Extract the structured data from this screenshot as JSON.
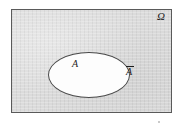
{
  "figure": {
    "kind": "venn-diagram",
    "caption": "",
    "universe": {
      "symbol": "Ω",
      "name": "omega-universal-set",
      "fill_color": "#d9d9d9",
      "border_color": "#5a5a5a"
    },
    "subset": {
      "symbol": "A",
      "name": "set-a",
      "fill_color": "#fdfdfd",
      "border_color": "#4a4a4a"
    },
    "complement": {
      "symbol": "A",
      "name": "set-a-complement",
      "notation": "overbar"
    }
  },
  "chart_data": {
    "type": "diagram",
    "title": "",
    "regions": [
      {
        "id": "omega",
        "label": "Ω",
        "description": "universal set (sample space) rectangle",
        "shape": "rectangle",
        "shaded": true,
        "x": 11,
        "y": 9,
        "width": 161,
        "height": 104
      },
      {
        "id": "A",
        "label": "A",
        "description": "event A, white ellipse inside the sample space",
        "shape": "ellipse",
        "shaded": false,
        "cx": 77,
        "cy": 65,
        "rx": 41,
        "ry": 23
      },
      {
        "id": "A-complement",
        "label": "Ā",
        "description": "complement of A, the shaded area of omega outside the ellipse",
        "shape": "rectangle-minus-ellipse",
        "shaded": true
      }
    ],
    "labels": [
      {
        "text": "Ω",
        "x": 163,
        "y": 16,
        "style": "italic-serif"
      },
      {
        "text": "A",
        "x": 77,
        "y": 64,
        "style": "italic-serif"
      },
      {
        "text": "Ā",
        "x": 131,
        "y": 72,
        "style": "italic-serif-overbar"
      }
    ]
  }
}
